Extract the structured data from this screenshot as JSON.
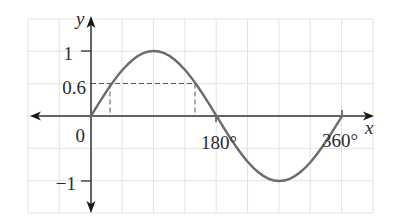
{
  "chart_data": {
    "type": "line",
    "title": "",
    "function": "y = sin x",
    "xlabel": "x",
    "ylabel": "y",
    "x_unit": "degrees",
    "x_ticks": [
      {
        "label": "180°",
        "value": 180
      },
      {
        "label": "360°",
        "value": 360
      }
    ],
    "y_ticks": [
      {
        "label": "1",
        "value": 1
      },
      {
        "label": "0.6",
        "value": 0.6
      },
      {
        "label": "0",
        "value": 0
      },
      {
        "label": "−1",
        "value": -1
      }
    ],
    "xlim": [
      -88,
      405
    ],
    "ylim": [
      -1.5,
      1.5
    ],
    "grid": true,
    "legend": null,
    "series": [
      {
        "name": "y = sin x",
        "color": "#6b6b6b",
        "x": [
          0,
          15,
          30,
          45,
          60,
          75,
          90,
          105,
          120,
          135,
          150,
          165,
          180,
          195,
          210,
          225,
          240,
          255,
          270,
          285,
          300,
          315,
          330,
          345,
          360
        ],
        "y": [
          0,
          0.259,
          0.5,
          0.707,
          0.866,
          0.966,
          1,
          0.966,
          0.866,
          0.707,
          0.5,
          0.259,
          0,
          -0.259,
          -0.5,
          -0.707,
          -0.866,
          -0.966,
          -1,
          -0.966,
          -0.866,
          -0.707,
          -0.5,
          -0.259,
          0
        ]
      }
    ],
    "annotations": [
      {
        "type": "dashed-guide",
        "label": "0.6",
        "y": 0.6,
        "x_intersections": [
          37,
          143
        ],
        "description": "horizontal dashed line at y = 0.6 meeting the curve, with dashed verticals dropped to the x-axis"
      }
    ]
  }
}
